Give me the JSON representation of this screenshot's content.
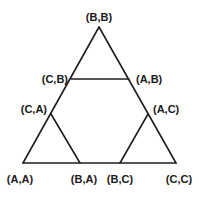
{
  "diagram": {
    "type": "triangle-state-diagram",
    "vertex_labels": {
      "top": "(B,B)",
      "upper_left": "(C,B)",
      "upper_right": "(A,B)",
      "mid_left": "(C,A)",
      "mid_right": "(A,C)",
      "bottom_left": "(A,A)",
      "bottom_center_left": "(B,A)",
      "bottom_center_right": "(B,C)",
      "bottom_right": "(C,C)"
    },
    "edges": [
      [
        "(B,B)",
        "(A,A)"
      ],
      [
        "(B,B)",
        "(C,C)"
      ],
      [
        "(A,A)",
        "(C,C)"
      ],
      [
        "(C,B)",
        "(A,B)"
      ],
      [
        "(C,A)",
        "(B,A)"
      ],
      [
        "(A,C)",
        "(B,C)"
      ]
    ],
    "line_color": "#1e1e1e",
    "text_color": "#1a1a1a"
  }
}
